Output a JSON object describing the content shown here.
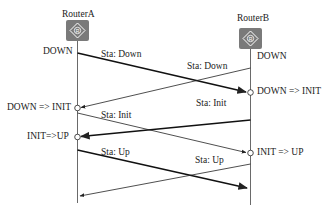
{
  "routers": [
    {
      "id": "a",
      "label": "RouterA",
      "icon": "router-icon",
      "icon_glyph": "R",
      "icon_color": "#7a7a7a"
    },
    {
      "id": "b",
      "label": "RouterB",
      "icon": "router-icon",
      "icon_color": "#7a7a7a",
      "icon_glyph": "R"
    }
  ],
  "states": {
    "a_initial": "DOWN",
    "b_initial": "DOWN",
    "a_transition_1": "DOWN => INIT",
    "b_transition_1": "DOWN => INIT",
    "a_transition_2": "INIT=>UP",
    "b_transition_2": "INIT => UP"
  },
  "messages": [
    {
      "from": "RouterA",
      "to": "RouterB",
      "label": "Sta: Down",
      "weight": "bold"
    },
    {
      "from": "RouterB",
      "to": "RouterA",
      "label": "Sta: Down",
      "weight": "thin"
    },
    {
      "from": "RouterB",
      "to": "RouterA",
      "label": "Sta: Init",
      "weight": "bold"
    },
    {
      "from": "RouterA",
      "to": "RouterB",
      "label": "Sta: Init",
      "weight": "thin"
    },
    {
      "from": "RouterA",
      "to": "RouterB",
      "label": "Sta: Up",
      "weight": "bold"
    },
    {
      "from": "RouterB",
      "to": "RouterA",
      "label": "Sta: Up",
      "weight": "thin"
    }
  ]
}
